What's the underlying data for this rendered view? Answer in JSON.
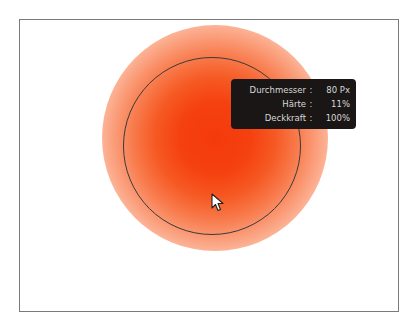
{
  "canvas": {
    "brush_color": "#f43a0c",
    "frame_color": "#7a7a7a"
  },
  "tooltip": {
    "rows": [
      {
        "label": "Durchmesser",
        "separator": ":",
        "value": "80 Px"
      },
      {
        "label": "Härte",
        "separator": ":",
        "value": "11%"
      },
      {
        "label": "Deckkraft",
        "separator": ":",
        "value": "100%"
      }
    ]
  },
  "cursor": {
    "icon": "arrow-pointer-icon"
  }
}
